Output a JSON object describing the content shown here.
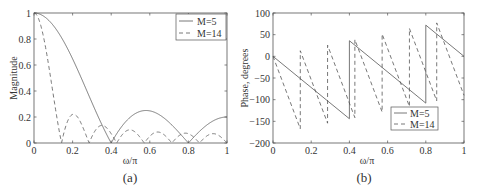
{
  "chart_data": [
    {
      "type": "line",
      "caption": "(a)",
      "title": "",
      "xlabel": "ω/π",
      "ylabel": "Magnitude",
      "xlim": [
        0,
        1
      ],
      "ylim": [
        0,
        1
      ],
      "xticks": [
        0,
        0.2,
        0.4,
        0.6,
        0.8,
        1
      ],
      "xtick_labels": [
        "0",
        "0.2",
        "0.4",
        "0.6",
        "0.8",
        "1"
      ],
      "yticks": [
        0,
        0.2,
        0.4,
        0.6,
        0.8,
        1
      ],
      "ytick_labels": [
        "0",
        "0.2",
        "0.4",
        "0.6",
        "0.8",
        "1"
      ],
      "grid": false,
      "legend_position": "upper right",
      "formula": "|sin(M·ω/2) / (M·sin(ω/2))|",
      "x": [
        0,
        0.05,
        0.1,
        0.15,
        0.2,
        0.25,
        0.3,
        0.35,
        0.4,
        0.45,
        0.5,
        0.55,
        0.6,
        0.65,
        0.7,
        0.75,
        0.8,
        0.85,
        0.9,
        0.95,
        1.0
      ],
      "series": [
        {
          "name": "M=5",
          "M": 5,
          "style": "solid",
          "values": [
            1.0,
            0.975,
            0.904,
            0.792,
            0.647,
            0.483,
            0.311,
            0.146,
            0.0,
            0.118,
            0.2,
            0.243,
            0.247,
            0.217,
            0.159,
            0.083,
            0.0,
            0.079,
            0.143,
            0.185,
            0.2
          ]
        },
        {
          "name": "M=14",
          "M": 14,
          "style": "dashed",
          "zeros": [
            0.143,
            0.286,
            0.429,
            0.571,
            0.714,
            0.857
          ],
          "sidelobe_peaks": [
            0.22,
            0.13,
            0.1,
            0.09,
            0.075,
            0.07
          ]
        }
      ]
    },
    {
      "type": "line",
      "caption": "(b)",
      "title": "",
      "xlabel": "ω/π",
      "ylabel": "Phase, degrees",
      "xlim": [
        0,
        1
      ],
      "ylim": [
        -200,
        100
      ],
      "xticks": [
        0,
        0.2,
        0.4,
        0.6,
        0.8,
        1
      ],
      "xtick_labels": [
        "0",
        "0.2",
        "0.4",
        "0.6",
        "0.8",
        "1"
      ],
      "yticks": [
        -200,
        -150,
        -100,
        -50,
        0,
        50,
        100
      ],
      "ytick_labels": [
        "−200",
        "−150",
        "−100",
        "−50",
        "0",
        "50",
        "100"
      ],
      "grid": false,
      "legend_position": "lower right",
      "formula": "−(M−1)/2·ω (deg) + 180° at each magnitude zero",
      "series": [
        {
          "name": "M=5",
          "M": 5,
          "style": "solid",
          "points": [
            [
              0,
              0
            ],
            [
              0.4,
              -144
            ],
            [
              0.4,
              36
            ],
            [
              0.8,
              -108
            ],
            [
              0.8,
              72
            ],
            [
              1.0,
              0
            ]
          ]
        },
        {
          "name": "M=14",
          "M": 14,
          "style": "dashed",
          "jump_points": [
            0.143,
            0.286,
            0.429,
            0.571,
            0.714,
            0.857
          ],
          "end_value": -90
        }
      ]
    }
  ],
  "legend": {
    "a": [
      "M=5",
      "M=14"
    ],
    "b": [
      "M=5",
      "M=14"
    ]
  },
  "colors": {
    "axis": "#555555",
    "line": "#555555",
    "text": "#333333"
  }
}
